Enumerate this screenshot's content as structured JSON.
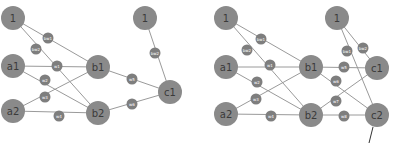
{
  "diagrams": [
    {
      "name": "network-left",
      "nodes": [
        {
          "id": "bias1",
          "label": "1",
          "x": 13,
          "y": 18,
          "r": 12
        },
        {
          "id": "a1",
          "label": "a1",
          "x": 13,
          "y": 66,
          "r": 12
        },
        {
          "id": "a2",
          "label": "a2",
          "x": 13,
          "y": 111,
          "r": 12
        },
        {
          "id": "b1",
          "label": "b1",
          "x": 98,
          "y": 67,
          "r": 12
        },
        {
          "id": "b2",
          "label": "b2",
          "x": 98,
          "y": 113,
          "r": 12
        },
        {
          "id": "bias2",
          "label": "1",
          "x": 145,
          "y": 18,
          "r": 12
        },
        {
          "id": "c1",
          "label": "c1",
          "x": 170,
          "y": 92,
          "r": 12
        }
      ],
      "edges": [
        {
          "from": "bias1",
          "to": "b1",
          "weight": "bw1",
          "wx": 48,
          "wy": 38
        },
        {
          "from": "bias1",
          "to": "b2",
          "weight": "bw2",
          "wx": 36,
          "wy": 49
        },
        {
          "from": "a1",
          "to": "b1",
          "weight": "w1",
          "wx": 57,
          "wy": 66
        },
        {
          "from": "a1",
          "to": "b2",
          "weight": "w2",
          "wx": 45,
          "wy": 80
        },
        {
          "from": "a2",
          "to": "b1",
          "weight": "w3",
          "wx": 45,
          "wy": 97
        },
        {
          "from": "a2",
          "to": "b2",
          "weight": "w4",
          "wx": 59,
          "wy": 116
        },
        {
          "from": "b1",
          "to": "c1",
          "weight": "w5",
          "wx": 132,
          "wy": 79
        },
        {
          "from": "b2",
          "to": "c1",
          "weight": "w6",
          "wx": 132,
          "wy": 104
        },
        {
          "from": "bias2",
          "to": "c1",
          "weight": "bw2",
          "wx": 155,
          "wy": 53
        }
      ]
    },
    {
      "name": "network-right",
      "nodes": [
        {
          "id": "bias1",
          "label": "1",
          "x": 226,
          "y": 18,
          "r": 12
        },
        {
          "id": "a1",
          "label": "a1",
          "x": 226,
          "y": 67,
          "r": 12
        },
        {
          "id": "a2",
          "label": "a2",
          "x": 226,
          "y": 114,
          "r": 12
        },
        {
          "id": "b1",
          "label": "b1",
          "x": 311,
          "y": 67,
          "r": 12
        },
        {
          "id": "b2",
          "label": "b2",
          "x": 311,
          "y": 115,
          "r": 12
        },
        {
          "id": "bias2",
          "label": "1",
          "x": 337,
          "y": 18,
          "r": 12
        },
        {
          "id": "c1",
          "label": "c1",
          "x": 377,
          "y": 68,
          "r": 12
        },
        {
          "id": "c2",
          "label": "c2",
          "x": 377,
          "y": 115,
          "r": 12
        }
      ],
      "edges": [
        {
          "from": "bias1",
          "to": "b1",
          "weight": "bw1",
          "wx": 261,
          "wy": 39
        },
        {
          "from": "bias1",
          "to": "b2",
          "weight": "bw2",
          "wx": 247,
          "wy": 50
        },
        {
          "from": "a1",
          "to": "b1",
          "weight": "w1",
          "wx": 270,
          "wy": 65
        },
        {
          "from": "a1",
          "to": "b2",
          "weight": "w2",
          "wx": 257,
          "wy": 82
        },
        {
          "from": "a2",
          "to": "b1",
          "weight": "w3",
          "wx": 256,
          "wy": 99
        },
        {
          "from": "a2",
          "to": "b2",
          "weight": "w4",
          "wx": 271,
          "wy": 116
        },
        {
          "from": "b1",
          "to": "c1",
          "weight": "w5",
          "wx": 344,
          "wy": 67
        },
        {
          "from": "b1",
          "to": "c2",
          "weight": "w6",
          "wx": 336,
          "wy": 81
        },
        {
          "from": "b2",
          "to": "c1",
          "weight": "w7",
          "wx": 336,
          "wy": 101
        },
        {
          "from": "b2",
          "to": "c2",
          "weight": "w8",
          "wx": 344,
          "wy": 116
        },
        {
          "from": "bias2",
          "to": "c1",
          "weight": "bw2",
          "wx": 363,
          "wy": 48
        },
        {
          "from": "bias2",
          "to": "c2",
          "weight": "bw1",
          "wx": 347,
          "wy": 51
        }
      ],
      "pointer": {
        "x1": 373,
        "y1": 127,
        "x2": 369,
        "y2": 143
      }
    }
  ]
}
